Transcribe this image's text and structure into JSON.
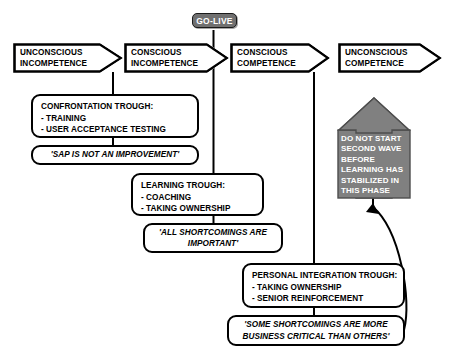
{
  "diagram": {
    "background_color": "#ffffff",
    "line_color": "#000000",
    "accent_gray": "#707070",
    "warning_fill": "#808080"
  },
  "golive": {
    "label": "GO-LIVE"
  },
  "stages": [
    {
      "id": "stage-1",
      "line1": "UNCONSCIOUS",
      "line2": "INCOMPETENCE"
    },
    {
      "id": "stage-2",
      "line1": "CONSCIOUS",
      "line2": "INCOMPETENCE"
    },
    {
      "id": "stage-3",
      "line1": "CONSCIOUS",
      "line2": "COMPETENCE"
    },
    {
      "id": "stage-4",
      "line1": "UNCONSCIOUS",
      "line2": "COMPETENCE"
    }
  ],
  "troughs": [
    {
      "id": "confrontation-trough",
      "heading": "CONFRONTATION TROUGH:",
      "items": [
        "- TRAINING",
        "- USER ACCEPTANCE TESTING"
      ],
      "quote_lines": [
        "'SAP IS NOT AN IMPROVEMENT'"
      ]
    },
    {
      "id": "learning-trough",
      "heading": "LEARNING TROUGH:",
      "items": [
        "- COACHING",
        "- TAKING OWNERSHIP"
      ],
      "quote_lines": [
        "'ALL SHORTCOMINGS ARE",
        "IMPORTANT'"
      ]
    },
    {
      "id": "personal-integration-trough",
      "heading": "PERSONAL INTEGRATION TROUGH:",
      "items": [
        "- TAKING OWNERSHIP",
        "- SENIOR REINFORCEMENT"
      ],
      "quote_lines": [
        "'SOME SHORTCOMINGS ARE MORE",
        "BUSINESS CRITICAL THAN OTHERS'"
      ]
    }
  ],
  "warning_arrow": {
    "lines": [
      "DO NOT START",
      "SECOND WAVE",
      "BEFORE",
      "LEARNING HAS",
      "STABILIZED IN",
      "THIS PHASE"
    ]
  }
}
